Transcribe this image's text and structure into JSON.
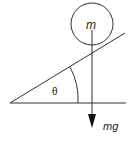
{
  "diagram": {
    "mass_label": "m",
    "angle_label": "θ",
    "force_label": "mg",
    "stroke_color": "#333333"
  }
}
